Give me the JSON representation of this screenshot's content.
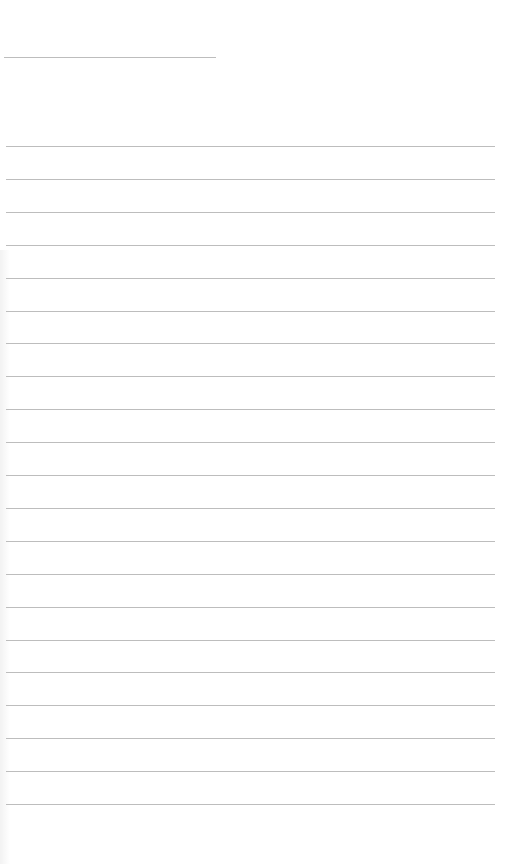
{
  "page": {
    "type": "blank lined paper",
    "background": "#ffffff",
    "line_color": "#bdbdbd",
    "header_rule": {
      "y": 57,
      "x_start": 4,
      "x_end": 216
    },
    "ruled_lines": {
      "count": 21,
      "first_y": 146,
      "spacing": 32.9,
      "x_start": 6,
      "x_end": 495
    }
  }
}
